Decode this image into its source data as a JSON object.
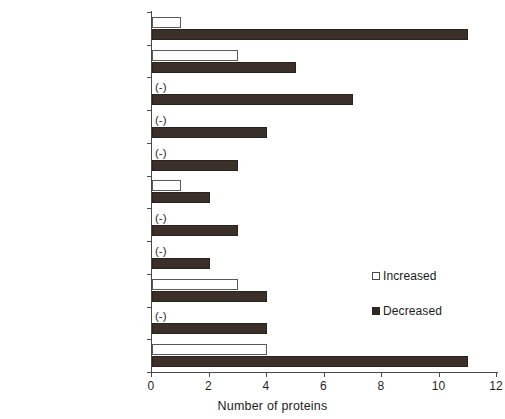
{
  "chart_data": {
    "type": "bar",
    "orientation": "horizontal",
    "title": "",
    "xlabel": "Number of proteins",
    "ylabel": "",
    "xlim": [
      0,
      12
    ],
    "xticks": [
      0,
      2,
      4,
      6,
      8,
      10,
      12
    ],
    "grid": false,
    "legend_position": "center-right",
    "zero_marker_text": "(-)",
    "categories": [
      "protein",
      "cell",
      "photosynthesis",
      "RNA",
      "signalling",
      "redox",
      "amino acid metabolism",
      "lipid metabolism",
      "others",
      "miscellaneous",
      "not assigned"
    ],
    "series": [
      {
        "name": "Increased",
        "color": "#ffffff",
        "values": [
          1,
          3,
          0,
          0,
          0,
          1,
          0,
          0,
          3,
          0,
          4
        ]
      },
      {
        "name": "Decreased",
        "color": "#3a3029",
        "values": [
          11,
          5,
          7,
          4,
          3,
          2,
          3,
          2,
          4,
          4,
          11
        ]
      }
    ]
  },
  "legend": {
    "entries": [
      {
        "label": "Increased",
        "swatch": "hollow-square-icon"
      },
      {
        "label": "Decreased",
        "swatch": "filled-square-icon"
      }
    ]
  },
  "axis": {
    "x_title": "Number of proteins",
    "tick_labels": [
      "0",
      "2",
      "4",
      "6",
      "8",
      "10",
      "12"
    ]
  }
}
